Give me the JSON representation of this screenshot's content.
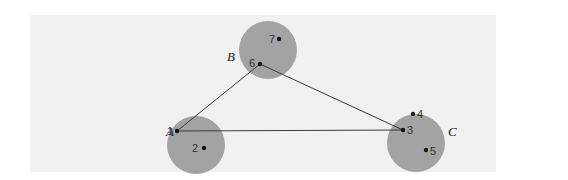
{
  "diagram": {
    "colors": {
      "background": "#ffffff",
      "panel": "#f1f1f1",
      "cluster_fill": "#a3a3a3",
      "edge": "#3a3a3a",
      "node": "#111111"
    },
    "clusters": [
      {
        "id": "A",
        "label": "A",
        "cx": 196,
        "cy": 145,
        "r": 29,
        "label_x": 166,
        "label_y": 136
      },
      {
        "id": "B",
        "label": "B",
        "cx": 268,
        "cy": 50,
        "r": 29,
        "label_x": 227,
        "label_y": 61
      },
      {
        "id": "C",
        "label": "C",
        "cx": 416,
        "cy": 143,
        "r": 29,
        "label_x": 448,
        "label_y": 136
      }
    ],
    "nodes": [
      {
        "id": "1",
        "label": "1",
        "cluster": "A",
        "x": 177,
        "y": 131,
        "label_x": 167,
        "label_y": 135
      },
      {
        "id": "2",
        "label": "2",
        "cluster": "A",
        "x": 204,
        "y": 148,
        "label_x": 192,
        "label_y": 152
      },
      {
        "id": "3",
        "label": "3",
        "cluster": "C",
        "x": 403,
        "y": 130,
        "label_x": 407,
        "label_y": 134
      },
      {
        "id": "4",
        "label": "4",
        "cluster": "C",
        "x": 413,
        "y": 114,
        "label_x": 417,
        "label_y": 118
      },
      {
        "id": "5",
        "label": "5",
        "cluster": "C",
        "x": 426,
        "y": 150,
        "label_x": 430,
        "label_y": 155
      },
      {
        "id": "6",
        "label": "6",
        "cluster": "B",
        "x": 260,
        "y": 64,
        "label_x": 249,
        "label_y": 67
      },
      {
        "id": "7",
        "label": "7",
        "cluster": "B",
        "x": 279,
        "y": 39,
        "label_x": 269,
        "label_y": 43
      }
    ],
    "edges": [
      {
        "from": "1",
        "to": "6"
      },
      {
        "from": "6",
        "to": "3"
      },
      {
        "from": "1",
        "to": "3"
      }
    ]
  }
}
